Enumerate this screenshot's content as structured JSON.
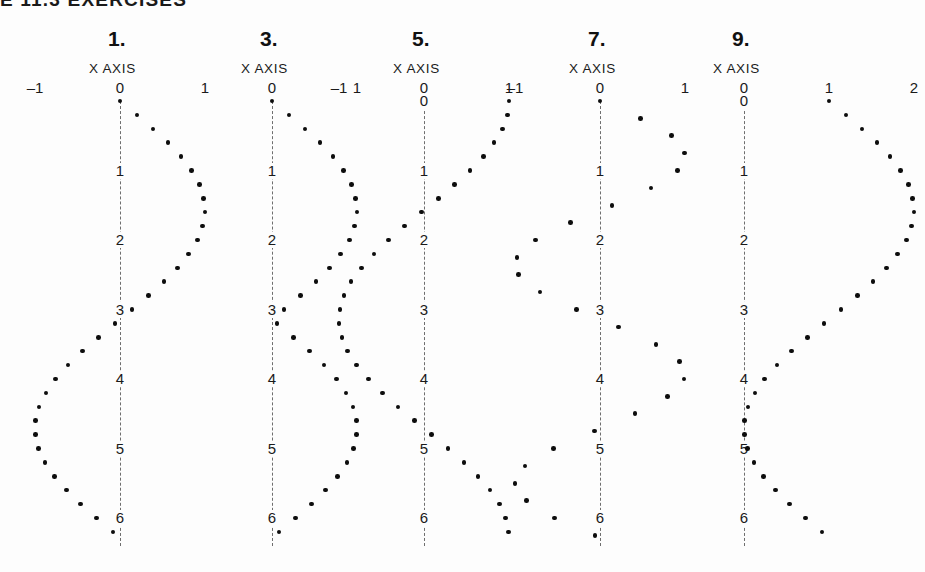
{
  "running_head": "E 11.3  EXERCISES",
  "page": {
    "background": "#fdfdfd",
    "ink": "#0d0d0d",
    "axis_color": "#6e6e6e"
  },
  "axis_caption_text": "X AXIS",
  "chart_data": [
    {
      "type": "scatter",
      "title": "1.",
      "xlabel": "X AXIS",
      "ylabel": "",
      "orientation": "vertical-y-axis",
      "xticks": [
        -1,
        0,
        1
      ],
      "xtick_labels": [
        "–1",
        "0",
        "1"
      ],
      "yticks": [
        0,
        1,
        2,
        3,
        4,
        5,
        6
      ],
      "ytick_labels": [
        "",
        "1",
        "2",
        "3",
        "4",
        "5",
        "6"
      ],
      "xlim": [
        -1.35,
        1.35
      ],
      "ylim": [
        0,
        6.4
      ],
      "grid": false,
      "legend": null,
      "expression": "sin(y)",
      "y": [
        0.0,
        0.2,
        0.4,
        0.6,
        0.8,
        1.0,
        1.2,
        1.4,
        1.6,
        1.8,
        2.0,
        2.2,
        2.4,
        2.6,
        2.8,
        3.0,
        3.2,
        3.4,
        3.6,
        3.8,
        4.0,
        4.2,
        4.4,
        4.6,
        4.8,
        5.0,
        5.2,
        5.4,
        5.6,
        5.8,
        6.0,
        6.2
      ],
      "x": [
        0.0,
        0.199,
        0.389,
        0.565,
        0.717,
        0.841,
        0.932,
        0.985,
        1.0,
        0.974,
        0.909,
        0.808,
        0.675,
        0.516,
        0.335,
        0.141,
        -0.058,
        -0.256,
        -0.443,
        -0.612,
        -0.757,
        -0.872,
        -0.952,
        -0.994,
        -0.996,
        -0.959,
        -0.883,
        -0.773,
        -0.631,
        -0.465,
        -0.279,
        -0.083
      ]
    },
    {
      "type": "scatter",
      "title": "3.",
      "xlabel": "X AXIS",
      "ylabel": "",
      "orientation": "vertical-y-axis",
      "xticks": [
        0,
        1
      ],
      "xtick_labels": [
        "0",
        "1"
      ],
      "yticks": [
        0,
        1,
        2,
        3,
        4,
        5,
        6
      ],
      "ytick_labels": [
        "",
        "1",
        "2",
        "3",
        "4",
        "5",
        "6"
      ],
      "xlim": [
        -0.15,
        1.3
      ],
      "ylim": [
        0,
        6.4
      ],
      "grid": false,
      "legend": null,
      "expression": "abs(sin(y))",
      "y": [
        0.0,
        0.2,
        0.4,
        0.6,
        0.8,
        1.0,
        1.2,
        1.4,
        1.6,
        1.8,
        2.0,
        2.2,
        2.4,
        2.6,
        2.8,
        3.0,
        3.2,
        3.4,
        3.6,
        3.8,
        4.0,
        4.2,
        4.4,
        4.6,
        4.8,
        5.0,
        5.2,
        5.4,
        5.6,
        5.8,
        6.0,
        6.2
      ],
      "x": [
        0.0,
        0.199,
        0.389,
        0.565,
        0.717,
        0.841,
        0.932,
        0.985,
        1.0,
        0.974,
        0.909,
        0.808,
        0.675,
        0.516,
        0.335,
        0.141,
        0.058,
        0.256,
        0.443,
        0.612,
        0.757,
        0.872,
        0.952,
        0.994,
        0.996,
        0.959,
        0.883,
        0.773,
        0.631,
        0.465,
        0.279,
        0.083
      ]
    },
    {
      "type": "scatter",
      "title": "5.",
      "xlabel": "X AXIS",
      "ylabel": "",
      "orientation": "vertical-y-axis",
      "xticks": [
        -1,
        0,
        1
      ],
      "xtick_labels": [
        "–1",
        "0",
        "1"
      ],
      "yticks": [
        0,
        1,
        2,
        3,
        4,
        5,
        6
      ],
      "ytick_labels": [
        "0",
        "1",
        "2",
        "3",
        "4",
        "5",
        "6"
      ],
      "xlim": [
        -1.35,
        1.35
      ],
      "ylim": [
        0,
        6.4
      ],
      "grid": false,
      "legend": null,
      "expression": "cos(y)",
      "y": [
        0.0,
        0.2,
        0.4,
        0.6,
        0.8,
        1.0,
        1.2,
        1.4,
        1.6,
        1.8,
        2.0,
        2.2,
        2.4,
        2.6,
        2.8,
        3.0,
        3.2,
        3.4,
        3.6,
        3.8,
        4.0,
        4.2,
        4.4,
        4.6,
        4.8,
        5.0,
        5.2,
        5.4,
        5.6,
        5.8,
        6.0,
        6.2
      ],
      "x": [
        1.0,
        0.98,
        0.921,
        0.825,
        0.697,
        0.54,
        0.362,
        0.17,
        -0.029,
        -0.227,
        -0.416,
        -0.589,
        -0.737,
        -0.857,
        -0.942,
        -0.99,
        -0.998,
        -0.967,
        -0.897,
        -0.791,
        -0.654,
        -0.49,
        -0.307,
        -0.112,
        0.087,
        0.284,
        0.469,
        0.635,
        0.776,
        0.886,
        0.96,
        0.997
      ]
    },
    {
      "type": "scatter",
      "title": "7.",
      "xlabel": "X AXIS",
      "ylabel": "",
      "orientation": "vertical-y-axis",
      "xticks": [
        -1,
        0,
        1
      ],
      "xtick_labels": [
        "–1",
        "0",
        "1"
      ],
      "yticks": [
        0,
        1,
        2,
        3,
        4,
        5,
        6
      ],
      "ytick_labels": [
        "",
        "1",
        "2",
        "3",
        "4",
        "5",
        "6"
      ],
      "xlim": [
        -1.35,
        1.35
      ],
      "ylim": [
        0,
        6.4
      ],
      "grid": false,
      "legend": null,
      "expression": "sin(2y)",
      "y": [
        0.0,
        0.25,
        0.5,
        0.75,
        1.0,
        1.25,
        1.5,
        1.75,
        2.0,
        2.25,
        2.5,
        2.75,
        3.0,
        3.25,
        3.5,
        3.75,
        4.0,
        4.25,
        4.5,
        4.75,
        5.0,
        5.25,
        5.5,
        5.75,
        6.0,
        6.25
      ],
      "x": [
        0.0,
        0.479,
        0.841,
        0.997,
        0.909,
        0.598,
        0.141,
        -0.35,
        -0.757,
        -0.978,
        -0.959,
        -0.706,
        -0.279,
        0.216,
        0.657,
        0.938,
        0.989,
        0.795,
        0.412,
        -0.068,
        -0.544,
        -0.88,
        -1.0,
        -0.868,
        -0.536,
        -0.059
      ]
    },
    {
      "type": "scatter",
      "title": "9.",
      "xlabel": "X AXIS",
      "ylabel": "",
      "orientation": "vertical-y-axis",
      "xticks": [
        0,
        1,
        2
      ],
      "xtick_labels": [
        "0",
        "1",
        "2"
      ],
      "yticks": [
        0,
        1,
        2,
        3,
        4,
        5,
        6
      ],
      "ytick_labels": [
        "0",
        "1",
        "2",
        "3",
        "4",
        "5",
        "6"
      ],
      "xlim": [
        -0.15,
        2.3
      ],
      "ylim": [
        0,
        6.4
      ],
      "grid": false,
      "legend": null,
      "expression": "1 + sin(y)",
      "y": [
        0.0,
        0.2,
        0.4,
        0.6,
        0.8,
        1.0,
        1.2,
        1.4,
        1.6,
        1.8,
        2.0,
        2.2,
        2.4,
        2.6,
        2.8,
        3.0,
        3.2,
        3.4,
        3.6,
        3.8,
        4.0,
        4.2,
        4.4,
        4.6,
        4.8,
        5.0,
        5.2,
        5.4,
        5.6,
        5.8,
        6.0,
        6.2
      ],
      "x": [
        1.0,
        1.199,
        1.389,
        1.565,
        1.717,
        1.841,
        1.932,
        1.985,
        2.0,
        1.974,
        1.909,
        1.808,
        1.675,
        1.516,
        1.335,
        1.141,
        0.942,
        0.744,
        0.557,
        0.388,
        0.243,
        0.128,
        0.048,
        0.006,
        0.004,
        0.041,
        0.117,
        0.227,
        0.369,
        0.535,
        0.721,
        0.917
      ]
    }
  ],
  "panel_layout": [
    {
      "left": 0,
      "axis_x": 120,
      "unit": 85,
      "title_x": 120,
      "caption_x": 120
    },
    {
      "left": 0,
      "axis_x": 272,
      "unit": 85,
      "title_x": 272,
      "caption_x": 272
    },
    {
      "left": 0,
      "axis_x": 424,
      "unit": 85,
      "title_x": 424,
      "caption_x": 424
    },
    {
      "left": 0,
      "axis_x": 600,
      "unit": 85,
      "title_x": 600,
      "caption_x": 600
    },
    {
      "left": 0,
      "axis_x": 744,
      "unit": 85,
      "title_x": 744,
      "caption_x": 744
    }
  ]
}
